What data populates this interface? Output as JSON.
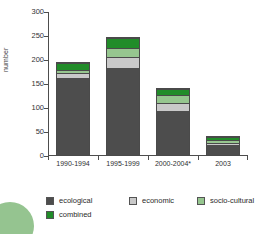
{
  "chart_data": {
    "type": "bar",
    "title": "",
    "xlabel": "",
    "ylabel": "number",
    "ylim": [
      0,
      300
    ],
    "ytick_labels": [
      "0",
      "50",
      "100",
      "150",
      "200",
      "250",
      "300"
    ],
    "ytick_values": [
      0,
      50,
      100,
      150,
      200,
      250,
      300
    ],
    "grid": false,
    "stacked": true,
    "legend_position": "bottom",
    "categories": [
      "1990-1994",
      "1995-1999",
      "2000-2004*",
      "2003"
    ],
    "series": [
      {
        "name": "ecological",
        "color": "#4d4d4d",
        "values": [
          170,
          190,
          100,
          27
        ]
      },
      {
        "name": "economic",
        "color": "#c9c9c9",
        "values": [
          8,
          20,
          15,
          5
        ]
      },
      {
        "name": "socio-cultural",
        "color": "#96c68f",
        "values": [
          5,
          18,
          15,
          3
        ]
      },
      {
        "name": "combined",
        "color": "#218c29",
        "values": [
          12,
          20,
          12,
          6
        ]
      }
    ],
    "totals": [
      195,
      248,
      142,
      41
    ]
  },
  "legend": {
    "items": [
      {
        "label": "ecological"
      },
      {
        "label": "economic"
      },
      {
        "label": "socio-cultural"
      },
      {
        "label": "combined"
      }
    ]
  },
  "decoration": {
    "circle_color": "#8cbf87"
  }
}
